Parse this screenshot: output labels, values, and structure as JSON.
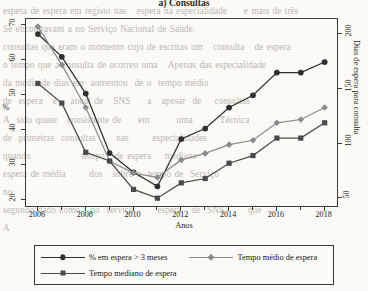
{
  "page": {
    "bleed_text": "espera de espera em registo nas   espera na especialidade     e mais de três\nSe encontravam a no Serviço Nacional de Saúde.\nconsultas que eram o momento cujo de escritas um   consulta   de espera\no tempo que a consulta de ocorreu uma   Apenas das especialidade   \nda média de dias em  aumentou  de o  tempo médio           \nde  espera   e    anual de   SNS     a   apesar  de    consultas        \nA  sido quase   consistente de     em        uma        Técnica                   \nde  primeiras  consultas      nas       especialidades                  \nquando               tempo   de espera    mediana                   \nespera de média       dos   sobre o  tempo de  Serviço             \nno                                                                \nsegundo dado como   ou  serviço       espera   de  SNS       que    \nA                                                                   "
  },
  "chart_data": {
    "type": "line",
    "title": "a)  Consultas",
    "xlabel": "Anos",
    "ylabel_left": "%",
    "ylabel_right": "Dias de espera para consulta",
    "grid": false,
    "legend_position": "bottom",
    "x": [
      2006,
      2007,
      2008,
      2009,
      2010,
      2011,
      2012,
      2013,
      2014,
      2015,
      2016,
      2017,
      2018
    ],
    "xlim": [
      2005.5,
      2018.6
    ],
    "xticks": [
      2006,
      2008,
      2010,
      2012,
      2014,
      2016,
      2018
    ],
    "xticks_minor": [
      2007,
      2009,
      2011,
      2013,
      2015,
      2017
    ],
    "ylim_left": [
      17.8,
      71.8
    ],
    "yticks_left": [
      20,
      30,
      40,
      50,
      60,
      70
    ],
    "ylim_right": [
      41,
      214
    ],
    "yticks_right": [
      50,
      100,
      150,
      200
    ],
    "series": [
      {
        "name": "% em espera > 3 meses",
        "axis": "left",
        "marker": "circle",
        "color": "#2f2f2f",
        "values": [
          67.5,
          61.0,
          50.5,
          33.5,
          28.0,
          24.0,
          37.5,
          40.5,
          46.5,
          50.0,
          56.5,
          56.5,
          59.5
        ]
      },
      {
        "name": "Tempo médio de espera",
        "axis": "right",
        "marker": "diamond",
        "color": "#8b8b8b",
        "values": [
          207.0,
          172.0,
          133.0,
          84.0,
          73.0,
          69.0,
          85.0,
          91.0,
          99.0,
          103.0,
          119.0,
          122.0,
          133.0
        ]
      },
      {
        "name": "Tempo mediano de espera",
        "axis": "right",
        "marker": "square",
        "color": "#4a4a4a",
        "values": [
          155.0,
          137.0,
          92.0,
          84.0,
          58.0,
          50.0,
          64.0,
          68.0,
          82.0,
          89.0,
          105.0,
          105.0,
          119.0
        ]
      }
    ]
  },
  "legend": {
    "items": [
      {
        "label": "% em espera > 3 meses",
        "marker": "circle-marker",
        "color": "#2f2f2f"
      },
      {
        "label": "Tempo médio de espera",
        "marker": "diamond-marker",
        "color": "#8b8b8b"
      },
      {
        "label": "Tempo mediano de espera",
        "marker": "square-marker",
        "color": "#4a4a4a"
      }
    ]
  }
}
